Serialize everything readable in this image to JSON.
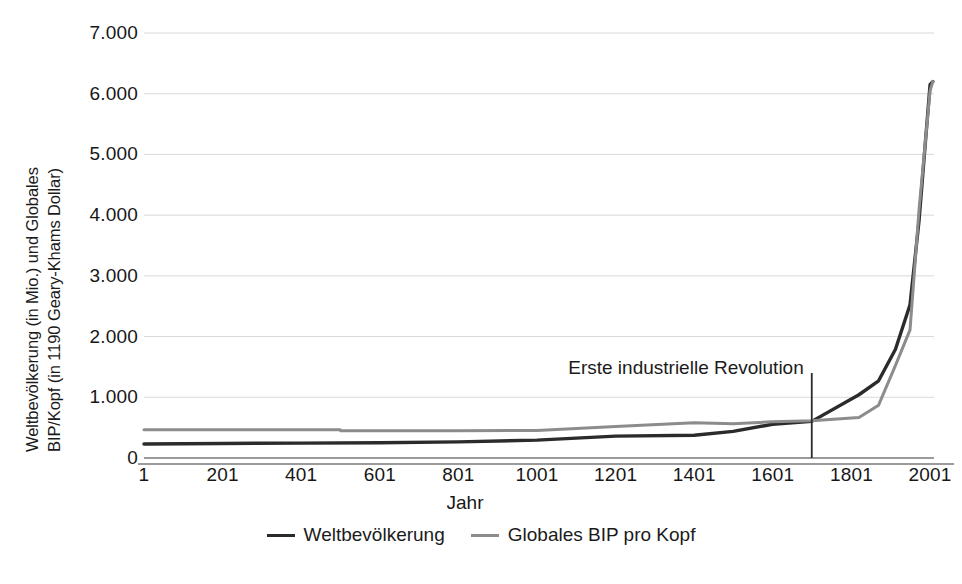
{
  "chart_data": {
    "type": "line",
    "title": "",
    "subtitle": "",
    "xlabel": "Jahr",
    "ylabel": "Weltbevölkerung (in Mio.) und Globales BIP/Kopf (in 1190 Geary-Khams Dollar)",
    "ylabel_line1": "Weltbevölkerung (in Mio.) und Globales",
    "ylabel_line2": "BIP/Kopf (in 1190 Geary-Khams Dollar)",
    "xlim": [
      1,
      2011
    ],
    "ylim": [
      0,
      7000
    ],
    "xticks": [
      1,
      201,
      401,
      601,
      801,
      1001,
      1201,
      1401,
      1601,
      1801,
      2001
    ],
    "xticklabels": [
      "1",
      "201",
      "401",
      "601",
      "801",
      "1001",
      "1201",
      "1401",
      "1601",
      "1801",
      "2001"
    ],
    "yticks": [
      0,
      1000,
      2000,
      3000,
      4000,
      5000,
      6000,
      7000
    ],
    "yticklabels": [
      "0",
      "1.000",
      "2.000",
      "3.000",
      "4.000",
      "5.000",
      "6.000",
      "7.000"
    ],
    "grid": true,
    "grid_axis": "y",
    "legend_position": "bottom",
    "series": [
      {
        "name": "Weltbevölkerung",
        "color": "#2b2b2b",
        "width": 3.4,
        "x": [
          1,
          201,
          401,
          601,
          801,
          1001,
          1201,
          1401,
          1500,
          1600,
          1700,
          1820,
          1870,
          1913,
          1950,
          1973,
          2001,
          2008
        ],
        "values": [
          231,
          240,
          245,
          250,
          265,
          295,
          360,
          375,
          438,
          556,
          603,
          1042,
          1272,
          1791,
          2524,
          3913,
          6149,
          6200
        ]
      },
      {
        "name": "Globales BIP pro Kopf",
        "color": "#8c8c8c",
        "width": 3.0,
        "x": [
          1,
          201,
          401,
          500,
          501,
          601,
          801,
          1001,
          1201,
          1401,
          1500,
          1600,
          1700,
          1820,
          1870,
          1913,
          1950,
          1973,
          2001,
          2008
        ],
        "values": [
          467,
          467,
          467,
          467,
          450,
          450,
          450,
          453,
          520,
          580,
          566,
          596,
          615,
          667,
          870,
          1525,
          2111,
          4091,
          6049,
          6200
        ]
      }
    ],
    "annotations": [
      {
        "text": "Erste industrielle Revolution",
        "x": 1700,
        "y": 1450,
        "marker_type": "vline",
        "marker_x": 1700,
        "marker_y_from": 0,
        "marker_y_to": 1400,
        "marker_color": "#2b2b2b"
      }
    ]
  },
  "legend": {
    "items": [
      {
        "label": "Weltbevölkerung",
        "color": "#2b2b2b"
      },
      {
        "label": "Globales BIP pro Kopf",
        "color": "#8c8c8c"
      }
    ]
  },
  "axes": {
    "x_title": "Jahr",
    "y_title_line1": "Weltbevölkerung (in Mio.) und Globales",
    "y_title_line2": "BIP/Kopf (in 1190 Geary-Khams Dollar)"
  },
  "colors": {
    "population_line": "#2b2b2b",
    "gdp_line": "#8c8c8c",
    "gridline": "#d9d9d9",
    "axis_line": "#7a7a7a",
    "text": "#1b1b1b",
    "background": "#ffffff"
  }
}
